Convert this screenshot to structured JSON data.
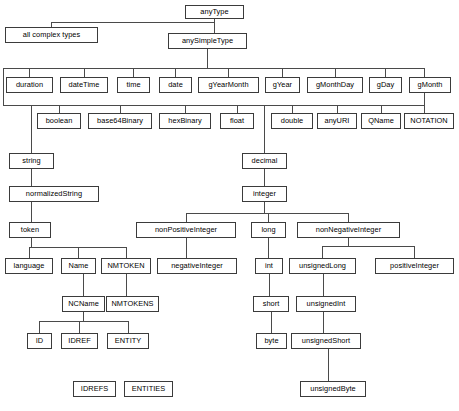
{
  "diagram": {
    "type": "tree-diagram",
    "orientation": "top-down",
    "box_fill": "#ffffff",
    "box_border": "#3b3b3b",
    "edge_color": "#4a4a4a",
    "text_color": "#000000",
    "canvas": {
      "width": 459,
      "height": 411
    },
    "nodes": [
      {
        "id": "anyType",
        "label": "anyType",
        "x": 185,
        "y": 5,
        "w": 59,
        "h": 14
      },
      {
        "id": "allComplexTypes",
        "label": "all complex types",
        "x": 5,
        "y": 27,
        "w": 93,
        "h": 16
      },
      {
        "id": "anySimpleType",
        "label": "anySimpleType",
        "x": 168,
        "y": 33,
        "w": 79,
        "h": 16
      },
      {
        "id": "duration",
        "label": "duration",
        "x": 6,
        "y": 77,
        "w": 47,
        "h": 16
      },
      {
        "id": "dateTime",
        "label": "dateTime",
        "x": 60,
        "y": 77,
        "w": 48,
        "h": 16
      },
      {
        "id": "time",
        "label": "time",
        "x": 117,
        "y": 77,
        "w": 33,
        "h": 16
      },
      {
        "id": "date",
        "label": "date",
        "x": 159,
        "y": 77,
        "w": 33,
        "h": 16
      },
      {
        "id": "gYearMonth",
        "label": "gYearMonth",
        "x": 198,
        "y": 77,
        "w": 61,
        "h": 16
      },
      {
        "id": "gYear",
        "label": "gYear",
        "x": 265,
        "y": 77,
        "w": 35,
        "h": 16
      },
      {
        "id": "gMonthDay",
        "label": "gMonthDay",
        "x": 307,
        "y": 77,
        "w": 56,
        "h": 16
      },
      {
        "id": "gDay",
        "label": "gDay",
        "x": 369,
        "y": 77,
        "w": 33,
        "h": 16
      },
      {
        "id": "gMonth",
        "label": "gMonth",
        "x": 409,
        "y": 77,
        "w": 42,
        "h": 16
      },
      {
        "id": "boolean",
        "label": "boolean",
        "x": 37,
        "y": 113,
        "w": 44,
        "h": 16
      },
      {
        "id": "base64Binary",
        "label": "base64Binary",
        "x": 88,
        "y": 113,
        "w": 64,
        "h": 16
      },
      {
        "id": "hexBinary",
        "label": "hexBinary",
        "x": 159,
        "y": 113,
        "w": 52,
        "h": 16
      },
      {
        "id": "float",
        "label": "float",
        "x": 220,
        "y": 113,
        "w": 34,
        "h": 16
      },
      {
        "id": "double",
        "label": "double",
        "x": 271,
        "y": 113,
        "w": 42,
        "h": 16
      },
      {
        "id": "anyURI",
        "label": "anyURI",
        "x": 317,
        "y": 113,
        "w": 40,
        "h": 16
      },
      {
        "id": "QName",
        "label": "QName",
        "x": 361,
        "y": 113,
        "w": 40,
        "h": 16
      },
      {
        "id": "NOTATION",
        "label": "NOTATION",
        "x": 404,
        "y": 113,
        "w": 50,
        "h": 16
      },
      {
        "id": "string",
        "label": "string",
        "x": 9,
        "y": 153,
        "w": 45,
        "h": 16
      },
      {
        "id": "decimal",
        "label": "decimal",
        "x": 242,
        "y": 153,
        "w": 45,
        "h": 16
      },
      {
        "id": "normalizedString",
        "label": "normalizedString",
        "x": 9,
        "y": 186,
        "w": 90,
        "h": 16
      },
      {
        "id": "integer",
        "label": "integer",
        "x": 242,
        "y": 186,
        "w": 45,
        "h": 16
      },
      {
        "id": "token",
        "label": "token",
        "x": 9,
        "y": 222,
        "w": 42,
        "h": 16
      },
      {
        "id": "nonPositiveInteger",
        "label": "nonPositiveInteger",
        "x": 136,
        "y": 222,
        "w": 100,
        "h": 16
      },
      {
        "id": "long",
        "label": "long",
        "x": 251,
        "y": 222,
        "w": 35,
        "h": 16
      },
      {
        "id": "nonNegativeInteger",
        "label": "nonNegativeInteger",
        "x": 297,
        "y": 222,
        "w": 103,
        "h": 16
      },
      {
        "id": "language",
        "label": "language",
        "x": 5,
        "y": 258,
        "w": 48,
        "h": 16
      },
      {
        "id": "Name",
        "label": "Name",
        "x": 61,
        "y": 258,
        "w": 35,
        "h": 16
      },
      {
        "id": "NMTOKEN",
        "label": "NMTOKEN",
        "x": 101,
        "y": 258,
        "w": 50,
        "h": 16
      },
      {
        "id": "negativeInteger",
        "label": "negativeInteger",
        "x": 157,
        "y": 258,
        "w": 80,
        "h": 16
      },
      {
        "id": "int",
        "label": "int",
        "x": 255,
        "y": 258,
        "w": 28,
        "h": 16
      },
      {
        "id": "unsignedLong",
        "label": "unsignedLong",
        "x": 289,
        "y": 258,
        "w": 67,
        "h": 16
      },
      {
        "id": "positiveInteger",
        "label": "positiveInteger",
        "x": 375,
        "y": 258,
        "w": 79,
        "h": 16
      },
      {
        "id": "NCName",
        "label": "NCName",
        "x": 62,
        "y": 296,
        "w": 43,
        "h": 16
      },
      {
        "id": "NMTOKENS",
        "label": "NMTOKENS",
        "x": 106,
        "y": 296,
        "w": 53,
        "h": 16
      },
      {
        "id": "short",
        "label": "short",
        "x": 253,
        "y": 296,
        "w": 36,
        "h": 16
      },
      {
        "id": "unsignedInt",
        "label": "unsignedInt",
        "x": 296,
        "y": 296,
        "w": 60,
        "h": 16
      },
      {
        "id": "ID",
        "label": "ID",
        "x": 27,
        "y": 333,
        "w": 25,
        "h": 16
      },
      {
        "id": "IDREF",
        "label": "IDREF",
        "x": 61,
        "y": 333,
        "w": 37,
        "h": 16
      },
      {
        "id": "ENTITY",
        "label": "ENTITY",
        "x": 107,
        "y": 333,
        "w": 42,
        "h": 16
      },
      {
        "id": "byte",
        "label": "byte",
        "x": 256,
        "y": 333,
        "w": 31,
        "h": 16
      },
      {
        "id": "unsignedShort",
        "label": "unsignedShort",
        "x": 291,
        "y": 333,
        "w": 70,
        "h": 16
      },
      {
        "id": "IDREFS",
        "label": "IDREFS",
        "x": 73,
        "y": 381,
        "w": 43,
        "h": 16
      },
      {
        "id": "ENTITIES",
        "label": "ENTITIES",
        "x": 124,
        "y": 381,
        "w": 49,
        "h": 16
      },
      {
        "id": "unsignedByte",
        "label": "unsignedByte",
        "x": 300,
        "y": 381,
        "w": 66,
        "h": 16
      }
    ],
    "edges": [
      {
        "from": "anyType",
        "to": "allComplexTypes"
      },
      {
        "from": "anyType",
        "to": "anySimpleType"
      },
      {
        "from": "anySimpleType",
        "to": "duration"
      },
      {
        "from": "anySimpleType",
        "to": "dateTime"
      },
      {
        "from": "anySimpleType",
        "to": "time"
      },
      {
        "from": "anySimpleType",
        "to": "date"
      },
      {
        "from": "anySimpleType",
        "to": "gYearMonth"
      },
      {
        "from": "anySimpleType",
        "to": "gYear"
      },
      {
        "from": "anySimpleType",
        "to": "gMonthDay"
      },
      {
        "from": "anySimpleType",
        "to": "gDay"
      },
      {
        "from": "anySimpleType",
        "to": "gMonth"
      },
      {
        "from": "anySimpleType",
        "to": "boolean"
      },
      {
        "from": "anySimpleType",
        "to": "base64Binary"
      },
      {
        "from": "anySimpleType",
        "to": "hexBinary"
      },
      {
        "from": "anySimpleType",
        "to": "float"
      },
      {
        "from": "anySimpleType",
        "to": "double"
      },
      {
        "from": "anySimpleType",
        "to": "anyURI"
      },
      {
        "from": "anySimpleType",
        "to": "QName"
      },
      {
        "from": "anySimpleType",
        "to": "NOTATION"
      },
      {
        "from": "anySimpleType",
        "to": "string"
      },
      {
        "from": "anySimpleType",
        "to": "decimal"
      },
      {
        "from": "string",
        "to": "normalizedString"
      },
      {
        "from": "normalizedString",
        "to": "token"
      },
      {
        "from": "token",
        "to": "language"
      },
      {
        "from": "token",
        "to": "Name"
      },
      {
        "from": "token",
        "to": "NMTOKEN"
      },
      {
        "from": "Name",
        "to": "NCName"
      },
      {
        "from": "NMTOKEN",
        "to": "NMTOKENS"
      },
      {
        "from": "NCName",
        "to": "ID"
      },
      {
        "from": "NCName",
        "to": "IDREF"
      },
      {
        "from": "NCName",
        "to": "ENTITY"
      },
      {
        "from": "decimal",
        "to": "integer"
      },
      {
        "from": "integer",
        "to": "nonPositiveInteger"
      },
      {
        "from": "integer",
        "to": "long"
      },
      {
        "from": "integer",
        "to": "nonNegativeInteger"
      },
      {
        "from": "nonPositiveInteger",
        "to": "negativeInteger"
      },
      {
        "from": "long",
        "to": "int"
      },
      {
        "from": "nonNegativeInteger",
        "to": "unsignedLong"
      },
      {
        "from": "nonNegativeInteger",
        "to": "positiveInteger"
      },
      {
        "from": "int",
        "to": "short"
      },
      {
        "from": "unsignedLong",
        "to": "unsignedInt"
      },
      {
        "from": "short",
        "to": "byte"
      },
      {
        "from": "unsignedInt",
        "to": "unsignedShort"
      },
      {
        "from": "unsignedShort",
        "to": "unsignedByte"
      }
    ],
    "connectors": [
      {
        "name": "anytype-stem-down",
        "type": "v",
        "x": 214,
        "y": 19,
        "len": 8
      },
      {
        "name": "anytype-bus",
        "type": "h",
        "x": 51,
        "y": 22,
        "len": 164
      },
      {
        "name": "allcomplextypes-stem",
        "type": "v",
        "x": 51,
        "y": 22,
        "len": 5
      },
      {
        "name": "anysimpletype-stem-in",
        "type": "v",
        "x": 214,
        "y": 22,
        "len": 11
      },
      {
        "name": "anysimpletype-stem-out",
        "type": "v",
        "x": 207,
        "y": 49,
        "len": 19
      },
      {
        "name": "datetime-bus",
        "type": "h",
        "x": 3,
        "y": 68,
        "len": 422
      },
      {
        "name": "duration-stem",
        "type": "v",
        "x": 29,
        "y": 68,
        "len": 9
      },
      {
        "name": "datetime-stem",
        "type": "v",
        "x": 84,
        "y": 68,
        "len": 9
      },
      {
        "name": "time-stem",
        "type": "v",
        "x": 133,
        "y": 68,
        "len": 9
      },
      {
        "name": "date-stem",
        "type": "v",
        "x": 175,
        "y": 68,
        "len": 9
      },
      {
        "name": "gyearmonth-stem",
        "type": "v",
        "x": 228,
        "y": 68,
        "len": 9
      },
      {
        "name": "gyear-stem",
        "type": "v",
        "x": 282,
        "y": 68,
        "len": 9
      },
      {
        "name": "gmonthday-stem",
        "type": "v",
        "x": 335,
        "y": 68,
        "len": 9
      },
      {
        "name": "gday-stem",
        "type": "v",
        "x": 385,
        "y": 68,
        "len": 9
      },
      {
        "name": "gmonth-stem",
        "type": "v",
        "x": 424,
        "y": 68,
        "len": 9
      },
      {
        "name": "left-drop-to-bus2",
        "type": "v",
        "x": 3,
        "y": 68,
        "len": 37
      },
      {
        "name": "right-drop-to-bus2",
        "type": "v",
        "x": 424,
        "y": 68,
        "len": 37
      },
      {
        "name": "numeric-bus",
        "type": "h",
        "x": 3,
        "y": 105,
        "len": 422
      },
      {
        "name": "boolean-stem",
        "type": "v",
        "x": 59,
        "y": 105,
        "len": 9
      },
      {
        "name": "base64binary-stem",
        "type": "v",
        "x": 120,
        "y": 105,
        "len": 9
      },
      {
        "name": "hexbinary-stem",
        "type": "v",
        "x": 185,
        "y": 105,
        "len": 9
      },
      {
        "name": "float-stem",
        "type": "v",
        "x": 237,
        "y": 105,
        "len": 9
      },
      {
        "name": "double-stem",
        "type": "v",
        "x": 292,
        "y": 105,
        "len": 9
      },
      {
        "name": "anyuri-stem",
        "type": "v",
        "x": 337,
        "y": 105,
        "len": 9
      },
      {
        "name": "qname-stem",
        "type": "v",
        "x": 381,
        "y": 105,
        "len": 9
      },
      {
        "name": "notation-stem",
        "type": "v",
        "x": 424,
        "y": 105,
        "len": 9
      },
      {
        "name": "string-branch",
        "type": "v",
        "x": 31,
        "y": 105,
        "len": 49
      },
      {
        "name": "decimal-branch",
        "type": "v",
        "x": 264,
        "y": 105,
        "len": 49
      },
      {
        "name": "string-to-normalized",
        "type": "v",
        "x": 31,
        "y": 169,
        "len": 18
      },
      {
        "name": "normalized-to-token",
        "type": "v",
        "x": 31,
        "y": 202,
        "len": 21
      },
      {
        "name": "token-stem-down",
        "type": "v",
        "x": 31,
        "y": 238,
        "len": 9
      },
      {
        "name": "token-bus",
        "type": "h",
        "x": 29,
        "y": 247,
        "len": 98
      },
      {
        "name": "language-stem",
        "type": "v",
        "x": 29,
        "y": 247,
        "len": 12
      },
      {
        "name": "name-stem",
        "type": "v",
        "x": 78,
        "y": 247,
        "len": 12
      },
      {
        "name": "nmtoken-stem",
        "type": "v",
        "x": 126,
        "y": 247,
        "len": 12
      },
      {
        "name": "name-to-ncname",
        "type": "v",
        "x": 83,
        "y": 274,
        "len": 23
      },
      {
        "name": "nmtoken-to-nmtokens",
        "type": "v",
        "x": 126,
        "y": 274,
        "len": 23
      },
      {
        "name": "ncname-stem-down",
        "type": "v",
        "x": 83,
        "y": 312,
        "len": 9
      },
      {
        "name": "ncname-bus",
        "type": "h",
        "x": 39,
        "y": 321,
        "len": 89
      },
      {
        "name": "id-stem",
        "type": "v",
        "x": 39,
        "y": 321,
        "len": 13
      },
      {
        "name": "idref-stem",
        "type": "v",
        "x": 79,
        "y": 321,
        "len": 13
      },
      {
        "name": "entity-stem",
        "type": "v",
        "x": 128,
        "y": 321,
        "len": 13
      },
      {
        "name": "decimal-to-integer",
        "type": "v",
        "x": 264,
        "y": 169,
        "len": 18
      },
      {
        "name": "integer-stem-down",
        "type": "v",
        "x": 264,
        "y": 202,
        "len": 11
      },
      {
        "name": "integer-bus",
        "type": "h",
        "x": 186,
        "y": 213,
        "len": 163
      },
      {
        "name": "nonpositive-stem",
        "type": "v",
        "x": 186,
        "y": 213,
        "len": 10
      },
      {
        "name": "long-stem",
        "type": "v",
        "x": 268,
        "y": 213,
        "len": 10
      },
      {
        "name": "nonnegative-stem",
        "type": "v",
        "x": 348,
        "y": 213,
        "len": 10
      },
      {
        "name": "nonpositive-to-negative",
        "type": "v",
        "x": 186,
        "y": 238,
        "len": 21
      },
      {
        "name": "long-to-int",
        "type": "v",
        "x": 268,
        "y": 238,
        "len": 21
      },
      {
        "name": "nonneg-stem-down",
        "type": "v",
        "x": 348,
        "y": 238,
        "len": 8
      },
      {
        "name": "nonneg-bus",
        "type": "h",
        "x": 322,
        "y": 246,
        "len": 93
      },
      {
        "name": "unsignedlong-stem",
        "type": "v",
        "x": 322,
        "y": 246,
        "len": 13
      },
      {
        "name": "positiveinteger-stem",
        "type": "v",
        "x": 414,
        "y": 246,
        "len": 13
      },
      {
        "name": "int-to-short",
        "type": "v",
        "x": 269,
        "y": 274,
        "len": 23
      },
      {
        "name": "unsignedlong-to-int",
        "type": "v",
        "x": 323,
        "y": 274,
        "len": 23
      },
      {
        "name": "short-to-byte",
        "type": "v",
        "x": 271,
        "y": 312,
        "len": 22
      },
      {
        "name": "unsignedint-to-short",
        "type": "v",
        "x": 323,
        "y": 312,
        "len": 22
      },
      {
        "name": "unsignedshort-to-byte",
        "type": "v",
        "x": 328,
        "y": 349,
        "len": 33
      }
    ]
  }
}
